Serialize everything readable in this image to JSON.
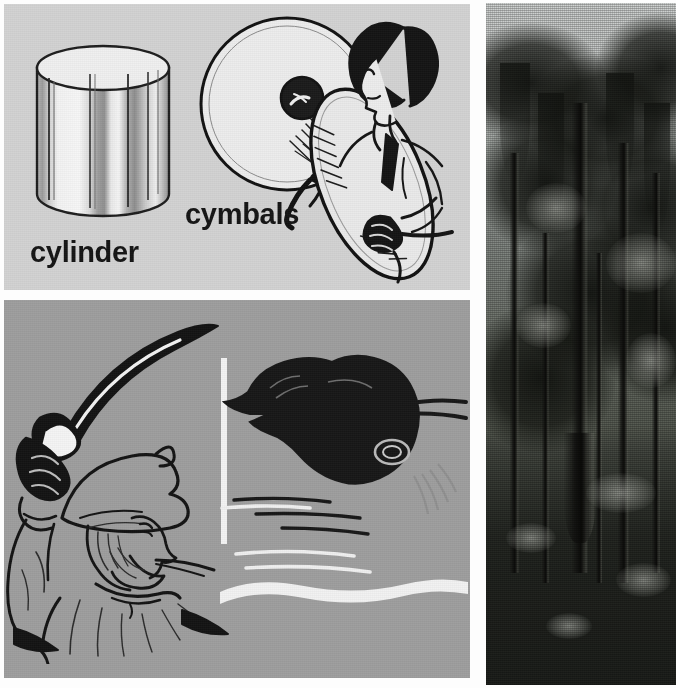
{
  "page": {
    "width": 676,
    "height": 688
  },
  "colors": {
    "panel_top_bg": "#d2d2d2",
    "panel_bottom_bg": "#9d9d9d",
    "page_bg": "#fdfdfd",
    "ink": "#141414",
    "highlight_white": "#f3f3f3"
  },
  "panels": [
    {
      "id": "panel-cylinder-cymbals",
      "name": "top-left-illustration-panel",
      "background": "#d2d2d2",
      "entries": [
        {
          "label": "cylinder",
          "figure": "cylinder-solid-shape"
        },
        {
          "label": "cymbals",
          "figure": "cymbal-player-figure"
        }
      ]
    },
    {
      "id": "panel-cutlass-cuttlefish",
      "name": "bottom-left-illustration-panel",
      "background": "#9d9d9d",
      "entries": [
        {
          "label": "cutlass",
          "figure": "pirate-with-curved-sword"
        },
        {
          "label": "cuttlefish",
          "caption": "45 cm (18 in.) long",
          "figure": "cuttlefish-swimming"
        }
      ]
    },
    {
      "id": "panel-cypress",
      "name": "right-photograph-panel",
      "entries": [
        {
          "label": "cypress",
          "figure": "cypress-swamp-photograph"
        }
      ]
    }
  ],
  "labels": {
    "cylinder": "cylinder",
    "cymbals": "cymbals",
    "cutlass": "cutlass",
    "cuttlefish": "cuttlefish",
    "cuttlefish_size": "45 cm (18 in.) long",
    "cypress": "cypress"
  },
  "measurements": {
    "cuttlefish_length_metric": "45 cm",
    "cuttlefish_length_imperial": "18 in."
  }
}
